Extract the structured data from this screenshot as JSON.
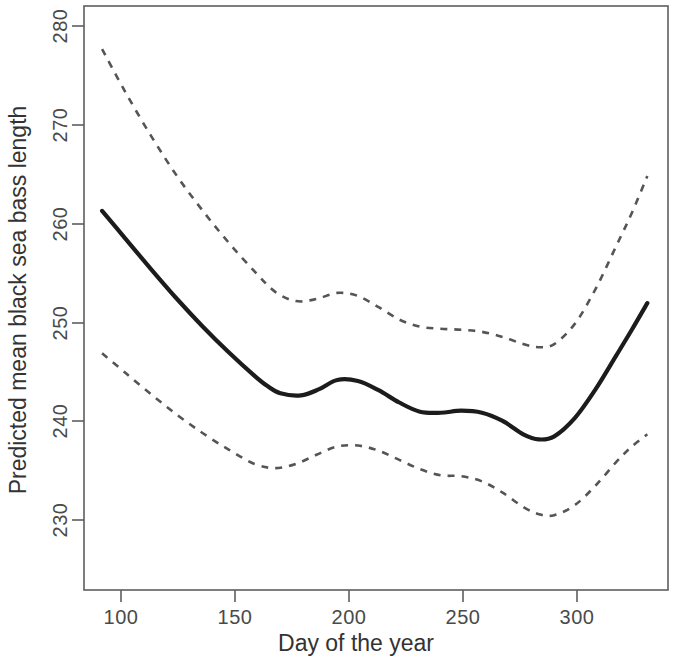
{
  "chart_data": {
    "type": "line",
    "title": "",
    "xlabel": "Day of the year",
    "ylabel": "Predicted mean black sea bass length",
    "xlim": [
      84,
      310
    ],
    "ylim": [
      225,
      282
    ],
    "grid": false,
    "legend": null,
    "xticks": [
      100,
      150,
      200,
      250,
      300
    ],
    "xtick_labels": [
      "100",
      "150",
      "200",
      "250",
      "300"
    ],
    "yticks": [
      230,
      240,
      250,
      260,
      270,
      280
    ],
    "ytick_labels": [
      "230",
      "240",
      "250",
      "260",
      "270",
      "280"
    ],
    "series": [
      {
        "name": "Predicted mean length",
        "style": "solid",
        "color": "#1c1c1c",
        "x": [
          91,
          100,
          110,
          120,
          130,
          140,
          150,
          155,
          160,
          168,
          175,
          182,
          190,
          198,
          206,
          214,
          222,
          230,
          238,
          246,
          254,
          260,
          266,
          274,
          282,
          290,
          296,
          302
        ],
        "values": [
          262.0,
          259.3,
          256.3,
          253.4,
          250.7,
          248.2,
          245.9,
          244.9,
          244.2,
          244.0,
          244.6,
          245.5,
          245.4,
          244.5,
          243.3,
          242.4,
          242.3,
          242.5,
          242.3,
          241.5,
          240.2,
          239.7,
          240.0,
          241.8,
          244.6,
          247.9,
          250.4,
          253.0
        ]
      },
      {
        "name": "Upper 95% confidence limit",
        "style": "dashed",
        "color": "#555555",
        "x": [
          91,
          100,
          110,
          120,
          130,
          140,
          150,
          158,
          166,
          174,
          182,
          190,
          198,
          206,
          214,
          222,
          230,
          238,
          246,
          254,
          260,
          266,
          274,
          282,
          290,
          296,
          302
        ],
        "values": [
          277.8,
          273.6,
          269.3,
          265.4,
          262.0,
          258.9,
          256.1,
          254.1,
          253.2,
          253.4,
          254.0,
          253.7,
          252.6,
          251.4,
          250.7,
          250.5,
          250.4,
          250.2,
          249.7,
          249.0,
          248.7,
          249.0,
          251.0,
          254.4,
          258.6,
          261.8,
          265.4
        ]
      },
      {
        "name": "Lower 95% confidence limit",
        "style": "dashed",
        "color": "#555555",
        "x": [
          91,
          100,
          110,
          120,
          130,
          140,
          150,
          158,
          166,
          174,
          182,
          190,
          198,
          206,
          214,
          222,
          230,
          238,
          246,
          254,
          260,
          266,
          274,
          282,
          290,
          296,
          302
        ],
        "values": [
          248.1,
          246.2,
          244.1,
          242.1,
          240.3,
          238.7,
          237.3,
          236.9,
          237.3,
          238.2,
          239.0,
          239.1,
          238.6,
          237.7,
          236.8,
          236.2,
          236.1,
          235.6,
          234.5,
          233.1,
          232.4,
          232.3,
          233.3,
          235.2,
          237.5,
          239.0,
          240.2
        ]
      }
    ]
  },
  "axes": {
    "x_axis_title": "Day of the year",
    "y_axis_title": "Predicted mean black sea bass length"
  }
}
